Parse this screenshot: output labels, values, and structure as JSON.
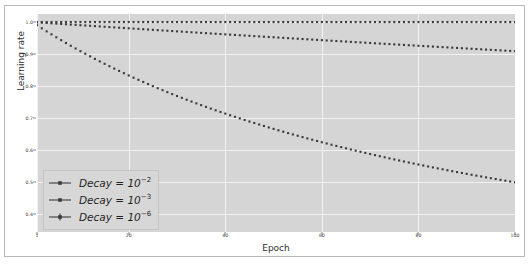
{
  "chart_data": {
    "type": "line",
    "title": "",
    "xlabel": "Epoch",
    "ylabel": "Learning rate",
    "xlim": [
      1,
      100
    ],
    "ylim": [
      0.345,
      1.025
    ],
    "grid": true,
    "legend_position": "lower left",
    "xticks": [
      1,
      20,
      40,
      60,
      80,
      100
    ],
    "xticklabels": [
      "1",
      "20",
      "40",
      "60",
      "80",
      "100"
    ],
    "yticks": [
      0.4,
      0.5,
      0.6,
      0.7,
      0.8,
      0.9,
      1.0
    ],
    "yticklabels": [
      "0.4",
      "0.5",
      "0.6",
      "0.7",
      "0.8",
      "0.9",
      "1.0"
    ],
    "x": [
      1,
      3,
      5,
      7,
      9,
      11,
      13,
      15,
      17,
      19,
      21,
      23,
      25,
      27,
      29,
      31,
      33,
      35,
      37,
      39,
      41,
      43,
      45,
      47,
      49,
      51,
      53,
      55,
      57,
      59,
      61,
      63,
      65,
      67,
      69,
      71,
      73,
      75,
      77,
      79,
      81,
      83,
      85,
      87,
      89,
      91,
      93,
      95,
      97,
      99,
      100
    ],
    "series": [
      {
        "name": "Decay = 10⁻²",
        "decay": 0.01,
        "color": "#3b3b3b",
        "marker": "dot-dash",
        "values": [
          0.99,
          0.971,
          0.952,
          0.935,
          0.917,
          0.901,
          0.885,
          0.87,
          0.855,
          0.84,
          0.826,
          0.813,
          0.8,
          0.787,
          0.775,
          0.763,
          0.752,
          0.741,
          0.73,
          0.719,
          0.709,
          0.699,
          0.69,
          0.68,
          0.671,
          0.662,
          0.654,
          0.645,
          0.637,
          0.629,
          0.621,
          0.613,
          0.606,
          0.599,
          0.592,
          0.585,
          0.578,
          0.571,
          0.565,
          0.559,
          0.552,
          0.546,
          0.541,
          0.535,
          0.529,
          0.524,
          0.518,
          0.513,
          0.508,
          0.503,
          0.5
        ]
      },
      {
        "name": "Decay = 10⁻³",
        "decay": 0.001,
        "color": "#3b3b3b",
        "marker": "dot-dash",
        "values": [
          0.999,
          0.997,
          0.995,
          0.993,
          0.991,
          0.989,
          0.987,
          0.985,
          0.983,
          0.981,
          0.979,
          0.978,
          0.976,
          0.974,
          0.972,
          0.97,
          0.968,
          0.966,
          0.964,
          0.962,
          0.961,
          0.959,
          0.957,
          0.955,
          0.953,
          0.951,
          0.95,
          0.948,
          0.946,
          0.944,
          0.943,
          0.941,
          0.939,
          0.937,
          0.935,
          0.934,
          0.932,
          0.93,
          0.929,
          0.927,
          0.925,
          0.924,
          0.922,
          0.92,
          0.918,
          0.917,
          0.915,
          0.913,
          0.912,
          0.91,
          0.909
        ]
      },
      {
        "name": "Decay = 10⁻⁶",
        "decay": 1e-06,
        "color": "#3b3b3b",
        "marker": "dot-plus",
        "values": [
          1.0,
          1.0,
          1.0,
          1.0,
          1.0,
          1.0,
          1.0,
          1.0,
          1.0,
          1.0,
          1.0,
          1.0,
          1.0,
          1.0,
          1.0,
          1.0,
          1.0,
          1.0,
          1.0,
          1.0,
          1.0,
          1.0,
          1.0,
          1.0,
          1.0,
          1.0,
          1.0,
          1.0,
          1.0,
          1.0,
          1.0,
          1.0,
          1.0,
          1.0,
          1.0,
          1.0,
          1.0,
          1.0,
          1.0,
          1.0,
          1.0,
          1.0,
          1.0,
          1.0,
          1.0,
          1.0,
          1.0,
          1.0,
          1.0,
          1.0,
          1.0
        ]
      }
    ],
    "legend_entries": [
      {
        "label_base": "Decay = 10",
        "exponent": "−2",
        "full": "Decay = 10⁻²"
      },
      {
        "label_base": "Decay = 10",
        "exponent": "−3",
        "full": "Decay = 10⁻³"
      },
      {
        "label_base": "Decay = 10",
        "exponent": "−6",
        "full": "Decay = 10⁻⁶"
      }
    ],
    "colors": {
      "plot_background": "#d5d5d5",
      "figure_background": "#ffffff",
      "gridline": "#f2f2f2",
      "line": "#3b3b3b",
      "tick_text": "#3a3a3a"
    }
  }
}
